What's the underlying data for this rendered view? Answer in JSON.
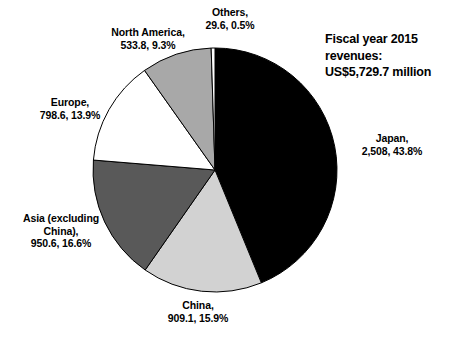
{
  "title": {
    "text": "Fiscal year 2015\nrevenues:\nUS$5,729.7 million"
  },
  "chart_data": {
    "type": "pie",
    "title": "Fiscal year 2015 revenues: US$5,729.7 million",
    "total": 5729.7,
    "units": "US$ million",
    "start_angle_deg": 0,
    "direction": "clockwise",
    "legend": "labels-outside",
    "grid": false,
    "categories": [
      "Japan",
      "China",
      "Asia (excluding China)",
      "Europe",
      "North America",
      "Others"
    ],
    "values": [
      2508,
      909.1,
      950.6,
      798.6,
      533.8,
      29.6
    ],
    "percentages": [
      43.8,
      15.9,
      16.6,
      13.9,
      9.3,
      0.5
    ],
    "colors": [
      "#000000",
      "#d2d2d2",
      "#595959",
      "#ffffff",
      "#a8a8a8",
      "#ffffff"
    ],
    "slices": [
      {
        "name": "Japan",
        "value": 2508,
        "value_text": "2,508",
        "percent": 43.8,
        "percent_text": "43.8%",
        "color": "#000000",
        "label": "Japan,\n2,508, 43.8%"
      },
      {
        "name": "China",
        "value": 909.1,
        "value_text": "909.1",
        "percent": 15.9,
        "percent_text": "15.9%",
        "color": "#d2d2d2",
        "label": "China,\n909.1, 15.9%"
      },
      {
        "name": "Asia (excluding China)",
        "value": 950.6,
        "value_text": "950.6",
        "percent": 16.6,
        "percent_text": "16.6%",
        "color": "#595959",
        "label": "Asia (excluding\nChina),\n950.6, 16.6%"
      },
      {
        "name": "Europe",
        "value": 798.6,
        "value_text": "798.6",
        "percent": 13.9,
        "percent_text": "13.9%",
        "color": "#ffffff",
        "label": "Europe,\n798.6, 13.9%"
      },
      {
        "name": "North America",
        "value": 533.8,
        "value_text": "533.8",
        "percent": 9.3,
        "percent_text": "9.3%",
        "color": "#a8a8a8",
        "label": "North America,\n533.8, 9.3%"
      },
      {
        "name": "Others",
        "value": 29.6,
        "value_text": "29.6",
        "percent": 0.5,
        "percent_text": "0.5%",
        "color": "#ffffff",
        "label": "Others,\n29.6, 0.5%"
      }
    ]
  },
  "geometry": {
    "cx": 215,
    "cy": 170,
    "r": 122
  }
}
